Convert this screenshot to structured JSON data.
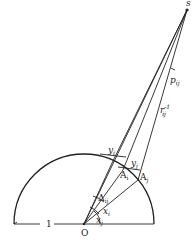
{
  "diagram": {
    "type": "geometric-construction",
    "points": {
      "origin": {
        "label": "O"
      },
      "external": {
        "label": "s"
      },
      "point_i": {
        "label": "A",
        "sub": "i"
      },
      "point_j": {
        "label": "A",
        "sub": "j"
      }
    },
    "labels": {
      "radius": "1",
      "angle_p": {
        "base": "p",
        "sub": "ij"
      },
      "distance_r": {
        "base": "r",
        "sub": "ij",
        "sup": "-1"
      },
      "angle_y_i": {
        "base": "y",
        "sub": "i"
      },
      "angle_y_j": {
        "base": "y",
        "sub": "j"
      },
      "angle_delta": {
        "base": "Δ",
        "sub": "ij"
      },
      "angle_x_i": {
        "base": "x",
        "sub": "i"
      },
      "angle_x_j": {
        "base": "x",
        "sub": "j"
      }
    },
    "colors": {
      "line": "#222222",
      "background": "#ffffff"
    }
  }
}
